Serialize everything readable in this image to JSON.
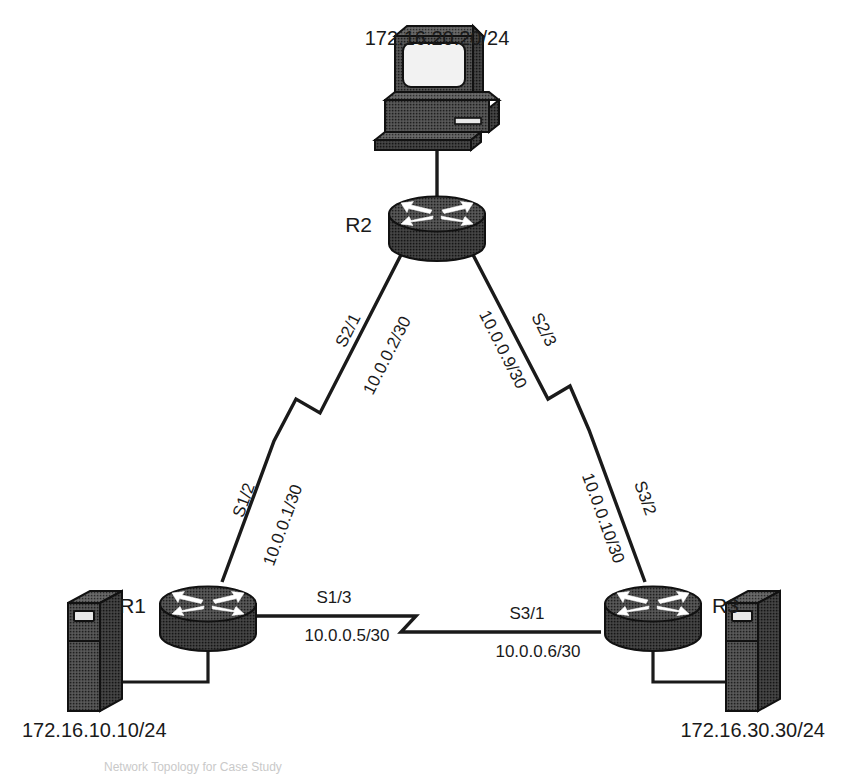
{
  "diagram": {
    "title": "Network Topology",
    "caption": "Network Topology for Case Study",
    "devices": [
      {
        "id": "pc",
        "name": "Workstation",
        "icon": "desktop-computer-icon",
        "label": "172.16.20.20/24"
      },
      {
        "id": "r2",
        "name": "Router R2",
        "icon": "router-icon",
        "label": "R2"
      },
      {
        "id": "r1",
        "name": "Router R1",
        "icon": "router-icon",
        "label": "R1"
      },
      {
        "id": "r3",
        "name": "Router R3",
        "icon": "router-icon",
        "label": "R3"
      },
      {
        "id": "srv1",
        "name": "Server 1",
        "icon": "server-tower-icon",
        "label": "172.16.10.10/24"
      },
      {
        "id": "srv3",
        "name": "Server 3",
        "icon": "server-tower-icon",
        "label": "172.16.30.30/24"
      }
    ],
    "links": [
      {
        "id": "r2-pc",
        "type": "ethernet",
        "from": "r2",
        "to": "pc",
        "from_interface": "",
        "from_address": "",
        "to_interface": "",
        "to_address": ""
      },
      {
        "id": "r1-r2",
        "type": "serial",
        "from": "r2",
        "to": "r1",
        "from_interface": "S2/1",
        "from_address": "10.0.0.2/30",
        "to_interface": "S1/2",
        "to_address": "10.0.0.1/30"
      },
      {
        "id": "r2-r3",
        "type": "serial",
        "from": "r2",
        "to": "r3",
        "from_interface": "S2/3",
        "from_address": "10.0.0.9/30",
        "to_interface": "S3/2",
        "to_address": "10.0.0.10/30"
      },
      {
        "id": "r1-r3",
        "type": "serial",
        "from": "r1",
        "to": "r3",
        "from_interface": "S1/3",
        "from_address": "10.0.0.5/30",
        "to_interface": "S3/1",
        "to_address": "10.0.0.6/30"
      },
      {
        "id": "r1-srv1",
        "type": "ethernet",
        "from": "r1",
        "to": "srv1",
        "from_interface": "",
        "from_address": "",
        "to_interface": "",
        "to_address": ""
      },
      {
        "id": "r3-srv3",
        "type": "ethernet",
        "from": "r3",
        "to": "srv3",
        "from_interface": "",
        "from_address": "",
        "to_interface": "",
        "to_address": ""
      }
    ],
    "colors": {
      "ink": "#1a1a1a",
      "device_fill": "#4a4a4a",
      "device_dark": "#2b2b2b",
      "background": "#ffffff"
    }
  }
}
